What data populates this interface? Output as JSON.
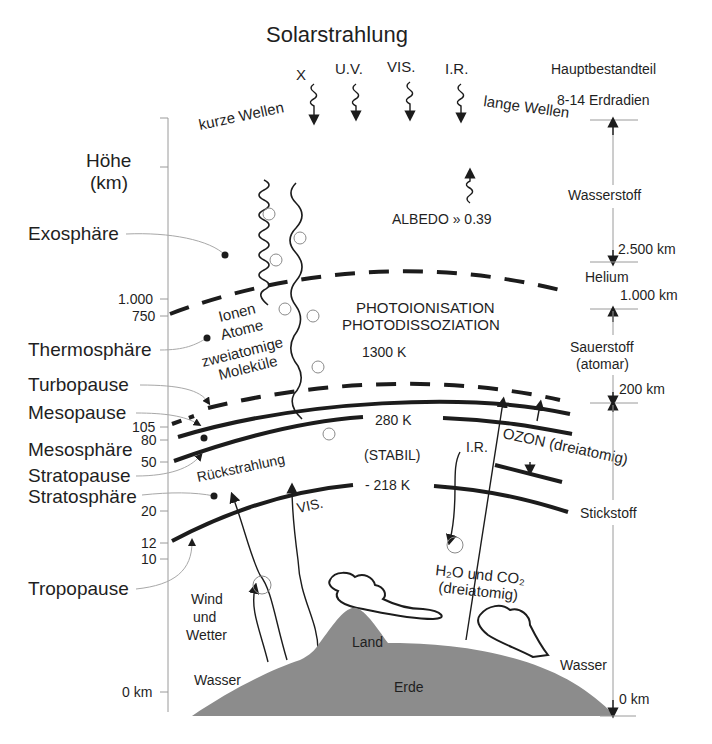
{
  "title": "Solarstrahlung",
  "radiation": {
    "bands": [
      "X",
      "U.V.",
      "VIS.",
      "I.R."
    ],
    "short_waves": "kurze Wellen",
    "long_waves": "lange Wellen",
    "albedo": "ALBEDO » 0.39"
  },
  "axis": {
    "title_line1": "Höhe",
    "title_line2": "(km)",
    "ticks": [
      "1.000",
      "750",
      "105",
      "80",
      "50",
      "20",
      "12",
      "10",
      "0 km"
    ]
  },
  "layers": {
    "exosphere": "Exosphäre",
    "thermosphere": "Thermosphäre",
    "turbopause": "Turbopause",
    "mesopause": "Mesopause",
    "mesosphere": "Mesosphäre",
    "stratopause": "Stratopause",
    "stratosphere": "Stratosphäre",
    "tropopause": "Tropopause"
  },
  "thermosphere_content": {
    "line1": "Ionen",
    "line2": "Atome",
    "line3": "zweiatomige",
    "line4": "Moleküle",
    "process1": "PHOTOIONISATION",
    "process2": "PHOTODISSOZIATION",
    "temp": "1300 K"
  },
  "middle": {
    "temp_mesopause": "280 K",
    "stable": "(STABIL)",
    "temp_strato": "- 218 K",
    "backradiation": "Rückstrahlung",
    "vis": "VIS.",
    "ir": "I.R.",
    "ozone": "OZON (dreiatomig)",
    "h2o_co2_line1": "H₂O und CO₂",
    "h2o_co2_line2": "(dreiatomig)"
  },
  "surface": {
    "wind1": "Wind",
    "wind2": "und",
    "wind3": "Wetter",
    "water_left": "Wasser",
    "land": "Land",
    "earth": "Erde",
    "water_right": "Wasser"
  },
  "composition": {
    "header": "Hauptbestandteil",
    "top": "8-14 Erdradien",
    "hydrogen": "Wasserstoff",
    "km2500": "2.500 km",
    "helium": "Helium",
    "km1000": "1.000 km",
    "oxygen1": "Sauerstoff",
    "oxygen2": "(atomar)",
    "km200": "200 km",
    "nitrogen": "Stickstoff",
    "km0": "0 km"
  },
  "colors": {
    "earth_fill": "#8c8c8c",
    "line": "#1c1c1c",
    "leader": "#a8a8a8"
  }
}
